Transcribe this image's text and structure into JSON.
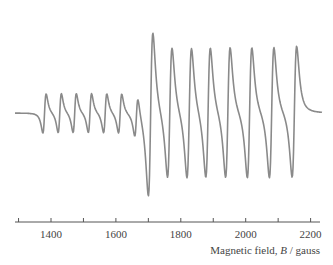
{
  "chart_data": {
    "type": "line",
    "title": "",
    "xlabel_prefix": "Magnetic field, ",
    "xlabel_symbol": "B",
    "xlabel_suffix": " / gauss",
    "ylabel": "",
    "xlim": [
      1270,
      2230
    ],
    "grid": false,
    "legend": null,
    "x_ticks": [
      1300,
      1400,
      1500,
      1600,
      1700,
      1800,
      1900,
      2000,
      2100,
      2200
    ],
    "x_tick_labels": [
      "1400",
      "1600",
      "1800",
      "2000",
      "2200"
    ],
    "series": [
      {
        "name": "weak lines",
        "centers_gauss": [
          1380,
          1427,
          1473,
          1520,
          1567,
          1613,
          1663
        ],
        "relative_amplitude": 0.3
      },
      {
        "name": "strong lines",
        "centers_gauss": [
          1707,
          1766,
          1826,
          1884,
          1945,
          2012,
          2080,
          2150
        ],
        "relative_amplitude": 1.0
      }
    ],
    "color": "#8a8a8a"
  }
}
